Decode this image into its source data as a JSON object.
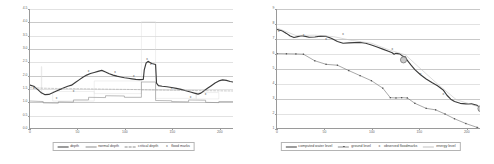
{
  "chart_data": [
    {
      "type": "line",
      "title": "",
      "xlabel": "",
      "ylabel": "",
      "xlim": [
        0,
        215
      ],
      "ylim": [
        0.0,
        4.5
      ],
      "xticks": [
        0,
        50,
        100,
        150,
        200
      ],
      "yticks": [
        "0.0",
        "0.5",
        "1.0",
        "1.5",
        "2.0",
        "2.5",
        "3.0",
        "3.5",
        "4.0",
        "4.5"
      ],
      "grid": true,
      "legend_position": "bottom",
      "legend": [
        {
          "label": "depth",
          "key": "solid-dark-line"
        },
        {
          "label": "normal depth",
          "key": "thin-gray-line"
        },
        {
          "label": "critical depth",
          "key": "dashed-gray-line"
        },
        {
          "label": "flood marks",
          "key": "x-marker"
        }
      ],
      "series": [
        {
          "name": "depth",
          "style": "solid-dark-line",
          "points": [
            [
              0,
              1.62
            ],
            [
              4,
              1.58
            ],
            [
              8,
              1.46
            ],
            [
              12,
              1.33
            ],
            [
              16,
              1.26
            ],
            [
              20,
              1.27
            ],
            [
              24,
              1.33
            ],
            [
              28,
              1.4
            ],
            [
              32,
              1.46
            ],
            [
              36,
              1.52
            ],
            [
              40,
              1.58
            ],
            [
              44,
              1.62
            ],
            [
              48,
              1.72
            ],
            [
              52,
              1.82
            ],
            [
              56,
              1.92
            ],
            [
              60,
              2.0
            ],
            [
              64,
              2.06
            ],
            [
              68,
              2.1
            ],
            [
              72,
              2.14
            ],
            [
              76,
              2.18
            ],
            [
              80,
              2.12
            ],
            [
              84,
              2.05
            ],
            [
              88,
              2.0
            ],
            [
              92,
              1.96
            ],
            [
              96,
              1.93
            ],
            [
              100,
              1.9
            ],
            [
              104,
              1.88
            ],
            [
              108,
              1.86
            ],
            [
              112,
              1.84
            ],
            [
              116,
              1.83
            ],
            [
              120,
              1.84
            ],
            [
              121,
              2.2
            ],
            [
              123,
              2.46
            ],
            [
              125,
              2.52
            ],
            [
              127,
              2.48
            ],
            [
              129,
              2.44
            ],
            [
              131,
              2.42
            ],
            [
              133,
              2.4
            ],
            [
              134,
              1.7
            ],
            [
              136,
              1.6
            ],
            [
              140,
              1.58
            ],
            [
              145,
              1.56
            ],
            [
              150,
              1.53
            ],
            [
              155,
              1.5
            ],
            [
              160,
              1.46
            ],
            [
              165,
              1.41
            ],
            [
              170,
              1.36
            ],
            [
              175,
              1.31
            ],
            [
              178,
              1.28
            ],
            [
              181,
              1.32
            ],
            [
              184,
              1.4
            ],
            [
              188,
              1.5
            ],
            [
              192,
              1.6
            ],
            [
              196,
              1.7
            ],
            [
              200,
              1.78
            ],
            [
              204,
              1.82
            ],
            [
              208,
              1.8
            ],
            [
              212,
              1.76
            ],
            [
              215,
              1.74
            ]
          ]
        },
        {
          "name": "normal depth",
          "style": "thin-gray-line",
          "points": [
            [
              0,
              1.02
            ],
            [
              14,
              1.0
            ],
            [
              14,
              0.95
            ],
            [
              30,
              0.94
            ],
            [
              30,
              0.99
            ],
            [
              46,
              0.98
            ],
            [
              46,
              1.06
            ],
            [
              62,
              1.06
            ],
            [
              62,
              1.16
            ],
            [
              80,
              1.15
            ],
            [
              80,
              1.22
            ],
            [
              100,
              1.21
            ],
            [
              100,
              1.16
            ],
            [
              118,
              1.16
            ],
            [
              118,
              1.74
            ],
            [
              133,
              1.74
            ],
            [
              133,
              1.04
            ],
            [
              150,
              1.03
            ],
            [
              150,
              1.0
            ],
            [
              168,
              0.99
            ],
            [
              168,
              1.06
            ],
            [
              186,
              1.05
            ],
            [
              186,
              0.97
            ],
            [
              200,
              0.96
            ],
            [
              200,
              1.0
            ],
            [
              215,
              1.0
            ]
          ]
        },
        {
          "name": "critical depth",
          "style": "dashed-gray-line",
          "points": [
            [
              0,
              1.52
            ],
            [
              20,
              1.5
            ],
            [
              40,
              1.49
            ],
            [
              60,
              1.48
            ],
            [
              80,
              1.47
            ],
            [
              100,
              1.46
            ],
            [
              118,
              1.45
            ],
            [
              118,
              1.45
            ],
            [
              133,
              1.44
            ],
            [
              150,
              1.43
            ],
            [
              170,
              1.42
            ],
            [
              190,
              1.41
            ],
            [
              215,
              1.4
            ]
          ]
        }
      ],
      "markers": [
        {
          "x": 4,
          "y": 1.52,
          "symbol": "x"
        },
        {
          "x": 28,
          "y": 1.13,
          "symbol": "x"
        },
        {
          "x": 46,
          "y": 1.38,
          "symbol": "x"
        },
        {
          "x": 62,
          "y": 2.14,
          "symbol": "x"
        },
        {
          "x": 90,
          "y": 2.13,
          "symbol": "x"
        },
        {
          "x": 110,
          "y": 1.95,
          "symbol": "x"
        },
        {
          "x": 124,
          "y": 2.62,
          "symbol": "x"
        },
        {
          "x": 128,
          "y": 2.42,
          "symbol": "x"
        },
        {
          "x": 150,
          "y": 1.52,
          "symbol": "x"
        },
        {
          "x": 170,
          "y": 1.17,
          "symbol": "x"
        },
        {
          "x": 186,
          "y": 1.3,
          "symbol": "x"
        }
      ],
      "annotation_boxes": [
        {
          "x0": 12,
          "x1": 12,
          "y0": 1.28,
          "y1": 2.32
        },
        {
          "x0": 24,
          "x1": 68,
          "y0": 1.02,
          "y1": 1.38
        },
        {
          "x0": 68,
          "x1": 118,
          "y0": 1.3,
          "y1": 1.78
        },
        {
          "x0": 118,
          "x1": 133,
          "y0": 1.42,
          "y1": 4.02
        },
        {
          "x0": 133,
          "x1": 176,
          "y0": 1.12,
          "y1": 1.42
        },
        {
          "x0": 176,
          "x1": 200,
          "y0": 1.1,
          "y1": 1.34
        }
      ]
    },
    {
      "type": "line",
      "title": "",
      "xlabel": "",
      "ylabel": "",
      "xlim": [
        0,
        215
      ],
      "ylim": [
        1,
        9
      ],
      "xticks": [
        0,
        50,
        100,
        150,
        200
      ],
      "yticks": [
        "1",
        "2",
        "3",
        "4",
        "5",
        "6",
        "7",
        "8",
        "9"
      ],
      "grid": true,
      "legend_position": "bottom",
      "legend": [
        {
          "label": "computed water level",
          "key": "solid-dark-line"
        },
        {
          "label": "ground level",
          "key": "dot-marker-line"
        },
        {
          "label": "observed floodmarks",
          "key": "x-marker"
        },
        {
          "label": "energy level",
          "key": "faint-gray-line"
        }
      ],
      "series": [
        {
          "name": "computed water level",
          "style": "solid-dark-line",
          "points": [
            [
              0,
              7.62
            ],
            [
              5,
              7.55
            ],
            [
              10,
              7.36
            ],
            [
              14,
              7.18
            ],
            [
              18,
              7.08
            ],
            [
              22,
              7.14
            ],
            [
              26,
              7.2
            ],
            [
              30,
              7.16
            ],
            [
              34,
              7.1
            ],
            [
              40,
              7.12
            ],
            [
              46,
              7.18
            ],
            [
              52,
              7.16
            ],
            [
              58,
              7.02
            ],
            [
              64,
              6.82
            ],
            [
              70,
              6.7
            ],
            [
              76,
              6.72
            ],
            [
              82,
              6.74
            ],
            [
              88,
              6.76
            ],
            [
              94,
              6.7
            ],
            [
              100,
              6.58
            ],
            [
              106,
              6.44
            ],
            [
              112,
              6.3
            ],
            [
              118,
              6.16
            ],
            [
              122,
              6.06
            ],
            [
              124,
              5.96
            ],
            [
              126,
              6.02
            ],
            [
              130,
              5.98
            ],
            [
              132,
              5.88
            ],
            [
              134,
              5.8
            ],
            [
              136,
              5.78
            ],
            [
              138,
              5.54
            ],
            [
              142,
              5.22
            ],
            [
              146,
              4.92
            ],
            [
              152,
              4.58
            ],
            [
              158,
              4.3
            ],
            [
              164,
              4.06
            ],
            [
              170,
              3.84
            ],
            [
              176,
              3.56
            ],
            [
              180,
              3.2
            ],
            [
              184,
              2.94
            ],
            [
              188,
              2.78
            ],
            [
              194,
              2.66
            ],
            [
              200,
              2.62
            ],
            [
              206,
              2.62
            ],
            [
              212,
              2.52
            ],
            [
              216,
              2.3
            ]
          ]
        },
        {
          "name": "ground level",
          "style": "dot-marker-line",
          "points": [
            [
              0,
              6.0
            ],
            [
              10,
              5.99
            ],
            [
              20,
              5.98
            ],
            [
              28,
              5.96
            ],
            [
              40,
              5.52
            ],
            [
              52,
              5.28
            ],
            [
              64,
              5.22
            ],
            [
              76,
              4.86
            ],
            [
              88,
              4.52
            ],
            [
              100,
              4.18
            ],
            [
              112,
              3.68
            ],
            [
              120,
              3.04
            ],
            [
              126,
              3.02
            ],
            [
              132,
              3.04
            ],
            [
              138,
              3.02
            ],
            [
              146,
              2.66
            ],
            [
              158,
              2.32
            ],
            [
              168,
              2.22
            ],
            [
              178,
              1.94
            ],
            [
              188,
              1.62
            ],
            [
              200,
              1.3
            ],
            [
              212,
              1.04
            ],
            [
              216,
              0.92
            ]
          ]
        },
        {
          "name": "energy level",
          "style": "faint-gray-line",
          "points": [
            [
              0,
              7.72
            ],
            [
              20,
              7.22
            ],
            [
              40,
              7.24
            ],
            [
              60,
              7.14
            ],
            [
              80,
              6.88
            ],
            [
              100,
              6.7
            ],
            [
              120,
              6.22
            ],
            [
              136,
              5.92
            ],
            [
              150,
              5.1
            ],
            [
              170,
              3.96
            ],
            [
              190,
              2.9
            ],
            [
              216,
              2.38
            ]
          ]
        }
      ],
      "markers": [
        {
          "x": 2,
          "y": 7.54,
          "symbol": "x"
        },
        {
          "x": 28,
          "y": 7.24,
          "symbol": "x"
        },
        {
          "x": 52,
          "y": 7.0,
          "symbol": "x"
        },
        {
          "x": 70,
          "y": 7.3,
          "symbol": "x"
        },
        {
          "x": 122,
          "y": 6.28,
          "symbol": "x"
        },
        {
          "x": 152,
          "y": 4.66,
          "symbol": "x"
        },
        {
          "x": 176,
          "y": 3.3,
          "symbol": "x"
        }
      ],
      "circle_markers": [
        {
          "x": 134,
          "y": 5.58
        },
        {
          "x": 216,
          "y": 2.3
        }
      ]
    }
  ]
}
